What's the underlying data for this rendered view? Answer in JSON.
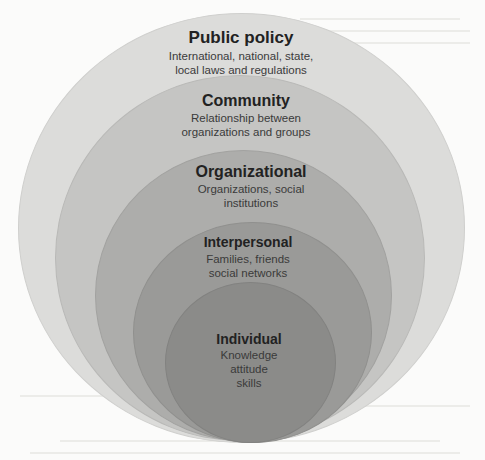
{
  "diagram": {
    "type": "nested-ellipses",
    "name": "Social ecological model",
    "levels": [
      {
        "title": "Public policy",
        "lines": [
          "International, national, state,",
          "local laws and regulations"
        ],
        "color": "#dcdcda"
      },
      {
        "title": "Community",
        "lines": [
          "Relationship between",
          "organizations and groups"
        ],
        "color": "#c4c4c2"
      },
      {
        "title": "Organizational",
        "lines": [
          "Organizations, social",
          "institutions"
        ],
        "color": "#acacaa"
      },
      {
        "title": "Interpersonal",
        "lines": [
          "Families, friends",
          "social networks"
        ],
        "color": "#999997"
      },
      {
        "title": "Individual",
        "lines": [
          "Knowledge",
          "attitude",
          "skills"
        ],
        "color": "#8a8a88"
      }
    ]
  }
}
